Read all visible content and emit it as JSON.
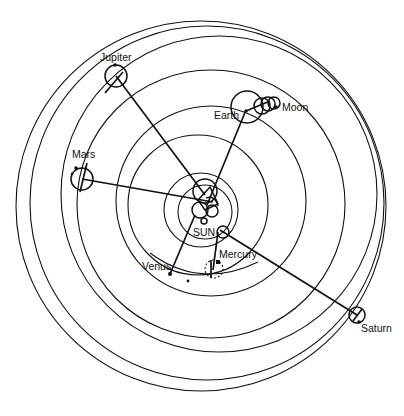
{
  "diagram": {
    "colors": {
      "ink": "#111111",
      "background": "#ffffff"
    },
    "labels": {
      "sun": "SUN",
      "mercury": "Mercury",
      "venus": "Venus",
      "earth": "Earth",
      "moon": "Moon",
      "mars": "Mars",
      "jupiter": "Jupiter",
      "saturn": "Saturn"
    },
    "orbits": [
      {
        "name": "saturn-deferent",
        "cx": 201,
        "cy": 206,
        "r": 185
      },
      {
        "name": "saturn-inner-deferent",
        "cx": 219,
        "cy": 194,
        "r": 158
      },
      {
        "name": "jupiter-deferent",
        "cx": 211,
        "cy": 204,
        "r": 134
      },
      {
        "name": "mars-deferent",
        "cx": 211,
        "cy": 201,
        "r": 95
      },
      {
        "name": "earth-deferent",
        "cx": 198,
        "cy": 208,
        "r": 67
      },
      {
        "name": "venus-deferent",
        "cx": 201,
        "cy": 210,
        "r": 36
      },
      {
        "name": "mercury-deferent",
        "cx": 205,
        "cy": 212,
        "r": 27
      }
    ]
  }
}
